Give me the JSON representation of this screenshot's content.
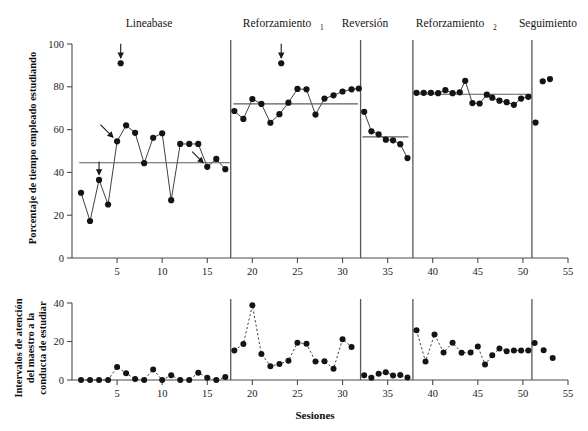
{
  "figure": {
    "xlabel": "Sesiones",
    "top_ylabel": "Porcentaje de tiempo empleado estudiando",
    "bottom_ylabel_line1": "Intervalos de atención",
    "bottom_ylabel_line2": "del maestro a la",
    "bottom_ylabel_line3": "conducta de estudiar"
  },
  "phases": [
    {
      "name": "Lineabase",
      "sub": "",
      "label_x": 9.0,
      "start": 0.5,
      "end": 17.6
    },
    {
      "name": "Reforzamiento",
      "sub": "1",
      "label_x": 24.3,
      "start": 17.6,
      "end": 32.0
    },
    {
      "name": "Reversión",
      "sub": "",
      "label_x": 34.8,
      "start": 32.0,
      "end": 37.8
    },
    {
      "name": "Reforzamiento",
      "sub": "2",
      "label_x": 44.0,
      "start": 37.8,
      "end": 51.0
    },
    {
      "name": "Seguimiento",
      "sub": "",
      "label_x": 53.2,
      "start": 51.0,
      "end": 55.0
    }
  ],
  "phase_dividers": [
    17.6,
    32.0,
    37.8,
    51.0
  ],
  "chart_data": [
    {
      "type": "line",
      "panel": "top",
      "title": "",
      "xlabel": "Sesiones",
      "ylabel": "Porcentaje de tiempo empleado estudiando",
      "xlim": [
        0,
        55
      ],
      "ylim": [
        0,
        100
      ],
      "xticks": [
        5,
        10,
        15,
        20,
        25,
        30,
        35,
        40,
        45,
        50,
        55
      ],
      "yticks": [
        0,
        20,
        40,
        60,
        80,
        100
      ],
      "grid": false,
      "legend": "none",
      "series": [
        {
          "name": "Lineabase",
          "x": [
            1,
            2,
            3,
            4,
            5,
            5.4,
            6,
            7,
            8,
            9,
            10,
            11,
            12,
            13,
            14,
            15,
            16,
            17
          ],
          "y": [
            30.5,
            17.3,
            36.5,
            25.0,
            54.5,
            91.0,
            62.0,
            58.5,
            44.3,
            56.2,
            58.3,
            27.0,
            53.3,
            53.3,
            53.3,
            42.6,
            46.3,
            41.5
          ],
          "outlier_index": 5,
          "mean": 44.5,
          "mean_x0": 0.8,
          "mean_x1": 17.5
        },
        {
          "name": "Reforzamiento 1",
          "x": [
            18,
            19,
            20,
            21,
            22,
            23,
            23.2,
            24,
            25,
            26,
            27,
            28,
            29,
            30,
            31,
            31.8
          ],
          "y": [
            68.7,
            65.0,
            74.3,
            72.0,
            63.2,
            67.2,
            91.0,
            72.6,
            79.0,
            78.8,
            67.0,
            74.5,
            76.0,
            77.8,
            78.8,
            79.2
          ],
          "outlier_index": 6,
          "mean": 72.0,
          "mean_x0": 17.9,
          "mean_x1": 31.7
        },
        {
          "name": "Reversión",
          "x": [
            32.4,
            33.2,
            34.0,
            34.8,
            35.6,
            36.4,
            37.2
          ],
          "y": [
            68.3,
            59.2,
            57.8,
            55.3,
            55.0,
            53.2,
            46.7
          ],
          "mean": 56.6,
          "mean_x0": 32.2,
          "mean_x1": 37.3
        },
        {
          "name": "Reforzamiento 2",
          "x": [
            38.2,
            39.0,
            39.8,
            40.6,
            41.4,
            42.2,
            43.0,
            43.6,
            44.4,
            45.2,
            46.0,
            46.6,
            47.4,
            48.2,
            49.0,
            49.8,
            50.6
          ],
          "y": [
            77.2,
            77.2,
            77.2,
            77.0,
            78.4,
            77.0,
            77.4,
            82.8,
            72.4,
            72.2,
            76.3,
            74.9,
            73.5,
            72.8,
            71.6,
            74.5,
            75.3
          ],
          "mean": 76.5,
          "mean_x0": 37.9,
          "mean_x1": 50.9
        },
        {
          "name": "Seguimiento",
          "x": [
            51.4,
            52.2,
            53.0
          ],
          "y": [
            63.3,
            82.6,
            83.6
          ],
          "scatter_only": true
        }
      ],
      "arrows": [
        {
          "x": 5.4,
          "y": 91.0,
          "dir": "down",
          "len": 14
        },
        {
          "x": 3.0,
          "y": 36.5,
          "dir": "down",
          "len": 13
        },
        {
          "x": 5.0,
          "y": 54.5,
          "dir": "down-right",
          "len": 16
        },
        {
          "x": 15.0,
          "y": 42.6,
          "dir": "down-right",
          "len": 14
        },
        {
          "x": 23.2,
          "y": 91.0,
          "dir": "down",
          "len": 14
        }
      ]
    },
    {
      "type": "line",
      "panel": "bottom",
      "title": "",
      "xlabel": "Sesiones",
      "ylabel": "Intervalos de atención del maestro a la conducta de estudiar",
      "xlim": [
        0,
        55
      ],
      "ylim": [
        0,
        40
      ],
      "xticks": [
        5,
        10,
        15,
        20,
        25,
        30,
        35,
        40,
        45,
        50,
        55
      ],
      "yticks": [
        0,
        20,
        40
      ],
      "grid": false,
      "legend": "none",
      "series": [
        {
          "name": "Lineabase",
          "x": [
            1,
            2,
            3,
            4,
            5,
            6,
            7,
            8,
            9,
            10,
            11,
            12,
            13,
            14,
            15,
            16,
            17
          ],
          "y": [
            0,
            0,
            0,
            0,
            6.8,
            3.5,
            0.5,
            0,
            5.5,
            0,
            2.5,
            0,
            0,
            3.8,
            1.2,
            0,
            1.5
          ]
        },
        {
          "name": "Reforzamiento 1",
          "x": [
            18,
            19,
            20,
            21,
            22,
            23,
            24,
            25,
            26,
            27,
            28,
            29,
            30,
            31
          ],
          "y": [
            15.3,
            18.7,
            38.8,
            13.5,
            7.2,
            8.3,
            10.0,
            19.4,
            18.8,
            9.6,
            9.8,
            5.8,
            21.2,
            17.2
          ]
        },
        {
          "name": "Reversión",
          "x": [
            32.4,
            33.2,
            34.0,
            34.8,
            35.6,
            36.4,
            37.2
          ],
          "y": [
            2.5,
            1.2,
            3.2,
            4.0,
            2.4,
            2.6,
            1.3
          ]
        },
        {
          "name": "Reforzamiento 2",
          "x": [
            38.2,
            39.2,
            40.2,
            41.2,
            42.2,
            43.2,
            44.2,
            45.0,
            45.8,
            46.6,
            47.4,
            48.2,
            49.0,
            49.8,
            50.6
          ],
          "y": [
            25.8,
            9.6,
            23.7,
            14.3,
            19.4,
            14.2,
            14.3,
            17.4,
            8.0,
            12.8,
            16.4,
            15.0,
            15.3,
            15.3,
            15.3
          ]
        },
        {
          "name": "Seguimiento",
          "x": [
            51.3,
            52.3,
            53.3
          ],
          "y": [
            19.2,
            15.4,
            11.4
          ],
          "scatter_only": true
        }
      ]
    }
  ]
}
